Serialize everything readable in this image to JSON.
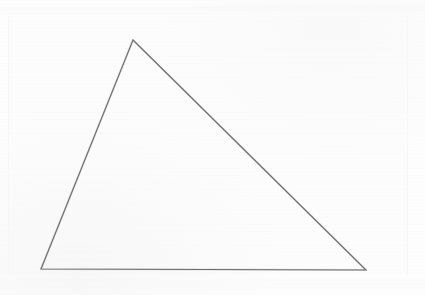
{
  "document": {
    "kind": "scanned-line-drawing",
    "title": "Hand-drawn triangle on white paper",
    "caption": "",
    "visible_text": "",
    "width": 425,
    "height": 295
  },
  "canvas": {
    "background_color": "#fefefe",
    "paper_color": "#fdfdfd",
    "paper_inset": {
      "left": 9,
      "top": 14,
      "width": 398,
      "height": 268
    }
  },
  "figure": {
    "name": "triangle",
    "shape": "triangle",
    "filled": false,
    "stroke_color": "#6e6e6e",
    "stroke_width": 1.1,
    "stroke_texture": "pencil-grain",
    "vertices": [
      {
        "label": "apex",
        "x": 133,
        "y": 40
      },
      {
        "label": "bottom-right",
        "x": 366,
        "y": 270
      },
      {
        "label": "bottom-left",
        "x": 41,
        "y": 269
      }
    ],
    "points_attr": "133,40 366,270 41,269",
    "edges": [
      {
        "name": "left-leg",
        "from": "bottom-left",
        "to": "apex"
      },
      {
        "name": "hypotenuse",
        "from": "apex",
        "to": "bottom-right"
      },
      {
        "name": "base",
        "from": "bottom-left",
        "to": "bottom-right"
      }
    ]
  },
  "annotations": {
    "labels": [],
    "measurements": []
  }
}
